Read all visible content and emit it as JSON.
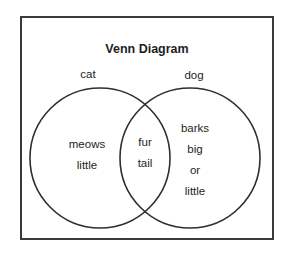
{
  "diagram": {
    "title": "Venn Diagram",
    "sets": [
      {
        "label": "cat",
        "only_items": [
          "meows",
          "little"
        ]
      },
      {
        "label": "dog",
        "only_items": [
          "barks",
          "big",
          "or",
          "little"
        ]
      }
    ],
    "intersection_items": [
      "fur",
      "tail"
    ],
    "stroke_color": "#2e2e2e",
    "background_color": "#ffffff"
  }
}
